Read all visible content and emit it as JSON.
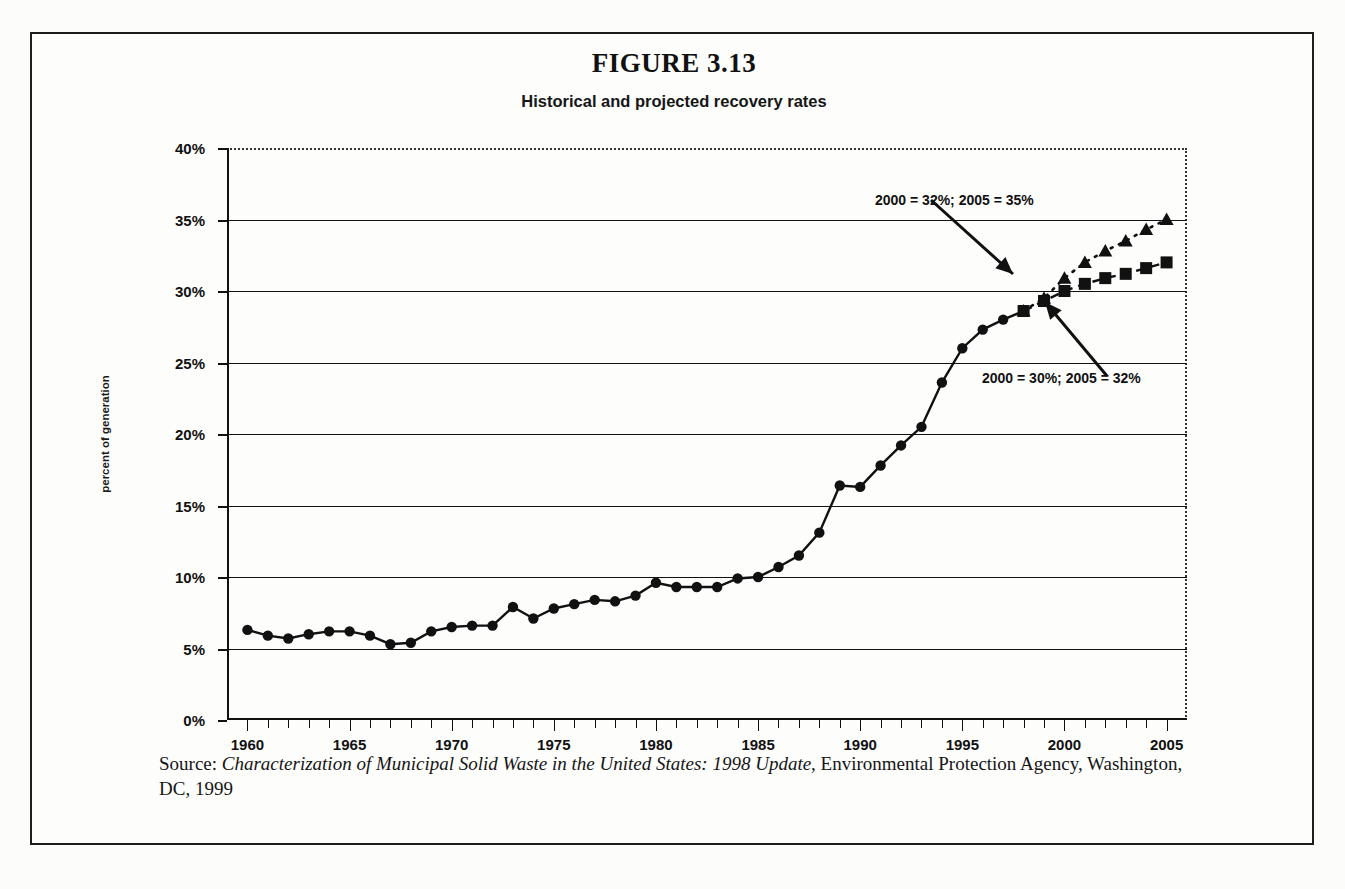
{
  "figure": {
    "number_label": "FIGURE 3.13",
    "subtitle": "Historical and projected recovery rates",
    "source_prefix": "Source: ",
    "source_title": "Characterization of Municipal Solid Waste in the United States: 1998 Update",
    "source_rest": ", Environmental Protection Agency, Washington, DC, 1999"
  },
  "annotations": {
    "high_projection": "2000 = 32%; 2005 = 35%",
    "low_projection": "2000 = 30%; 2005 = 32%"
  },
  "chart_data": {
    "type": "line",
    "title": "Historical and projected recovery rates",
    "xlabel": "",
    "ylabel": "percent of generation",
    "xlim": [
      1959,
      2006
    ],
    "ylim": [
      0,
      40
    ],
    "yticks": [
      "0%",
      "5%",
      "10%",
      "15%",
      "20%",
      "25%",
      "30%",
      "35%",
      "40%"
    ],
    "ytick_values": [
      0,
      5,
      10,
      15,
      20,
      25,
      30,
      35,
      40
    ],
    "xticks": [
      "1960",
      "1965",
      "1970",
      "1975",
      "1980",
      "1985",
      "1990",
      "1995",
      "2000",
      "2005"
    ],
    "xtick_values": [
      1960,
      1965,
      1970,
      1975,
      1980,
      1985,
      1990,
      1995,
      2000,
      2005
    ],
    "x_minor_step": 1,
    "grid": "horizontal",
    "legend": "none",
    "series": [
      {
        "name": "Historical recovery rate",
        "marker": "circle",
        "line_style": "solid",
        "x": [
          1960,
          1961,
          1962,
          1963,
          1964,
          1965,
          1966,
          1967,
          1968,
          1969,
          1970,
          1971,
          1972,
          1973,
          1974,
          1975,
          1976,
          1977,
          1978,
          1979,
          1980,
          1981,
          1982,
          1983,
          1984,
          1985,
          1986,
          1987,
          1988,
          1989,
          1990,
          1991,
          1992,
          1993,
          1994,
          1995,
          1996,
          1997,
          1998
        ],
        "y": [
          6.3,
          5.9,
          5.7,
          6.0,
          6.2,
          6.2,
          5.9,
          5.3,
          5.4,
          6.2,
          6.5,
          6.6,
          6.6,
          7.9,
          7.1,
          7.8,
          8.1,
          8.4,
          8.3,
          8.7,
          9.6,
          9.3,
          9.3,
          9.3,
          9.9,
          10.0,
          10.7,
          11.5,
          13.1,
          16.4,
          16.3,
          17.8,
          19.2,
          20.5,
          23.6,
          26.0,
          27.3,
          28.0,
          28.6
        ],
        "units": "percent of generation"
      },
      {
        "name": "High projection",
        "marker": "triangle",
        "line_style": "dotted",
        "x": [
          1998,
          1999,
          2000,
          2001,
          2002,
          2003,
          2004,
          2005
        ],
        "y": [
          28.6,
          29.5,
          30.9,
          32.0,
          32.8,
          33.5,
          34.3,
          35.0
        ],
        "units": "percent of generation",
        "callout": "2000 = 32%; 2005 = 35%"
      },
      {
        "name": "Low projection",
        "marker": "square",
        "line_style": "dashed",
        "x": [
          1998,
          1999,
          2000,
          2001,
          2002,
          2003,
          2004,
          2005
        ],
        "y": [
          28.6,
          29.3,
          30.0,
          30.5,
          30.9,
          31.2,
          31.6,
          32.0
        ],
        "units": "percent of generation",
        "callout": "2000 = 30%; 2005 = 32%"
      }
    ],
    "arrows": [
      {
        "label": "2000 = 32%; 2005 = 35%",
        "points_to_series": "High projection"
      },
      {
        "label": "2000 = 30%; 2005 = 32%",
        "points_to_series": "Low projection"
      }
    ]
  }
}
